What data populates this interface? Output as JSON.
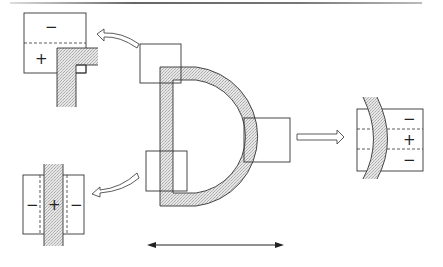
{
  "diagram": {
    "colors": {
      "stroke": "#333333",
      "shade": "#d9d9d9",
      "background": "#ffffff",
      "rule": "#888888"
    },
    "insets": {
      "top_left": {
        "signs": [
          "−",
          "+"
        ]
      },
      "right": {
        "signs": [
          "−",
          "+",
          "−"
        ]
      },
      "bottom_left": {
        "signs": [
          "−",
          "+",
          "−"
        ]
      }
    },
    "arrows": {
      "top_left": "curved hollow arrow pointing left",
      "right": "straight hollow arrow pointing right",
      "bottom_left": "curved hollow arrow pointing left",
      "bottom": "double-headed horizontal arrow"
    }
  }
}
